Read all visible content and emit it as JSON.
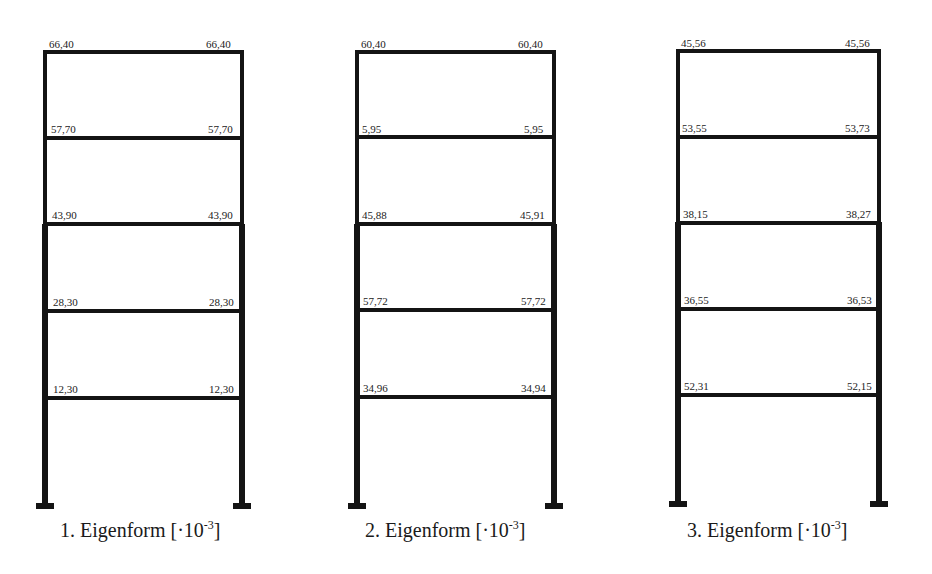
{
  "diagram": {
    "type": "frame-mode-shapes",
    "unit_note": "·10^-3",
    "frames": [
      {
        "caption_prefix": "1. Eigenform [·10",
        "caption_exp": "-3",
        "caption_suffix": "]",
        "floors": [
          {
            "left": "66,40",
            "right": "66,40"
          },
          {
            "left": "57,70",
            "right": "57,70"
          },
          {
            "left": "43,90",
            "right": "43,90"
          },
          {
            "left": "28,30",
            "right": "28,30"
          },
          {
            "left": "12,30",
            "right": "12,30"
          }
        ]
      },
      {
        "caption_prefix": "2. Eigenform [·10",
        "caption_exp": "-3",
        "caption_suffix": "]",
        "floors": [
          {
            "left": "60,40",
            "right": "60,40"
          },
          {
            "left": "5,95",
            "right": "5,95"
          },
          {
            "left": "45,88",
            "right": "45,91"
          },
          {
            "left": "57,72",
            "right": "57,72"
          },
          {
            "left": "34,96",
            "right": "34,94"
          }
        ]
      },
      {
        "caption_prefix": "3. Eigenform [·10",
        "caption_exp": "-3",
        "caption_suffix": "]",
        "floors": [
          {
            "left": "45,56",
            "right": "45,56"
          },
          {
            "left": "53,55",
            "right": "53,73"
          },
          {
            "left": "38,15",
            "right": "38,27"
          },
          {
            "left": "36,55",
            "right": "36,53"
          },
          {
            "left": "52,31",
            "right": "52,15"
          }
        ]
      }
    ]
  }
}
